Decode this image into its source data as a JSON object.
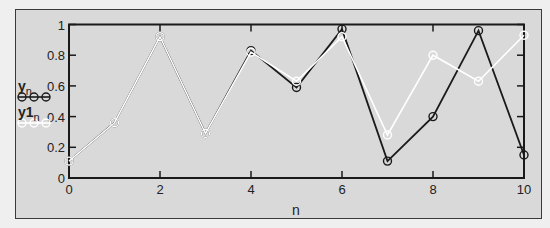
{
  "chart_data": {
    "type": "line",
    "title": "",
    "xlabel": "n",
    "ylabel": "",
    "x": [
      0,
      1,
      2,
      3,
      4,
      5,
      6,
      7,
      8,
      9,
      10
    ],
    "xlim": [
      0,
      10
    ],
    "ylim": [
      0,
      1
    ],
    "x_ticks": [
      "0",
      "2",
      "4",
      "6",
      "8",
      "10"
    ],
    "y_ticks": [
      "0",
      "0.2",
      "0.4",
      "0.6",
      "0.8",
      "1"
    ],
    "grid": false,
    "legend_position": "left",
    "series": [
      {
        "name": "y_n",
        "label": "y",
        "subscript": "n",
        "color": "#1a1a1a",
        "marker": "circle",
        "values": [
          0.11,
          0.36,
          0.92,
          0.29,
          0.83,
          0.59,
          0.97,
          0.11,
          0.4,
          0.96,
          0.15
        ]
      },
      {
        "name": "y1_n",
        "label": "y1",
        "subscript": "n",
        "color": "#ffffff",
        "marker": "circle",
        "values": [
          0.11,
          0.36,
          0.92,
          0.29,
          0.82,
          0.63,
          0.92,
          0.28,
          0.8,
          0.63,
          0.93
        ]
      }
    ]
  },
  "colors": {
    "background": "#efefef",
    "panel": "#d9d9d9",
    "axis": "#1a1a1a"
  }
}
